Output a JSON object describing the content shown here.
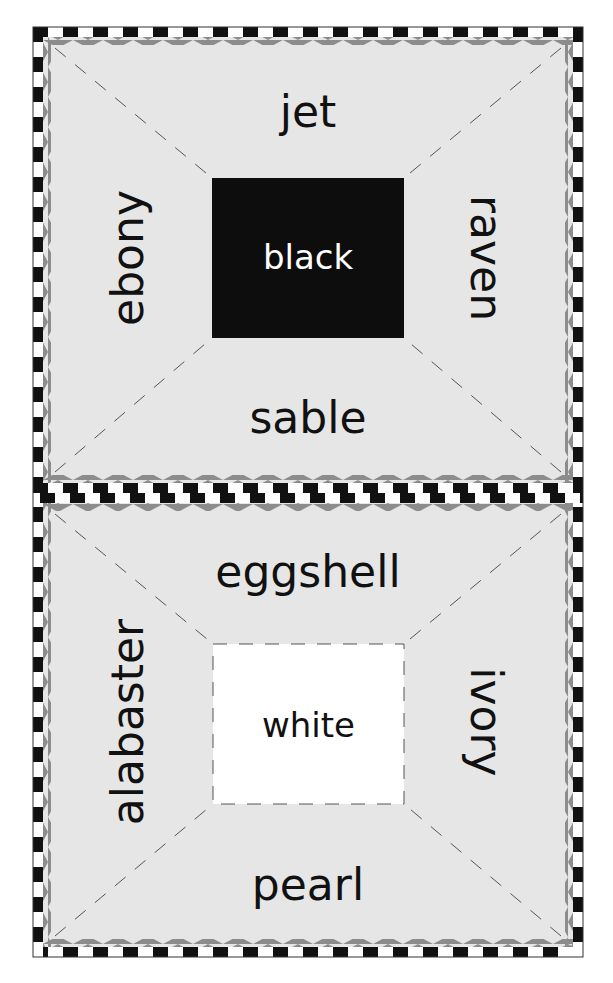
{
  "colors": {
    "panel_bg": "#e6e6e6",
    "checker_dark": "#111111",
    "checker_light": "#ffffff",
    "zigzag": "#8c8c8c",
    "guide_line": "#555555",
    "black_box": "#0d0d0d",
    "white_box": "#ffffff"
  },
  "panels": [
    {
      "id": "black",
      "center": {
        "label": "black",
        "style": "filled-black"
      },
      "top": "jet",
      "left": "ebony",
      "right": "raven",
      "bottom": "sable"
    },
    {
      "id": "white",
      "center": {
        "label": "white",
        "style": "white-dashed"
      },
      "top": "eggshell",
      "left": "alabaster",
      "right": "ivory",
      "bottom": "pearl"
    }
  ]
}
